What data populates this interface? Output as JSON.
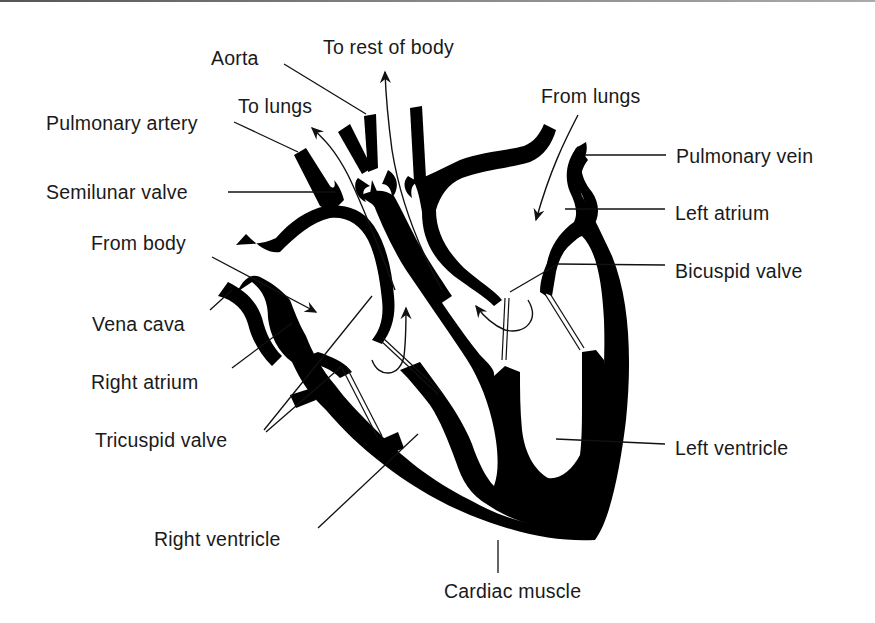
{
  "diagram": {
    "colors": {
      "muscle": "#000000",
      "background": "#ffffff",
      "text": "#1a1a1a"
    },
    "labels": {
      "aorta": "Aorta",
      "to_rest_of_body": "To rest of body",
      "from_lungs": "From lungs",
      "to_lungs": "To lungs",
      "pulmonary_artery": "Pulmonary artery",
      "pulmonary_vein": "Pulmonary vein",
      "semilunar_valve": "Semilunar valve",
      "left_atrium": "Left atrium",
      "from_body": "From body",
      "bicuspid_valve": "Bicuspid valve",
      "vena_cava": "Vena cava",
      "right_atrium": "Right atrium",
      "tricuspid_valve": "Tricuspid valve",
      "left_ventricle": "Left ventricle",
      "right_ventricle": "Right ventricle",
      "cardiac_muscle": "Cardiac muscle"
    },
    "flow_arrows": [
      {
        "name": "to-rest-of-body-arrow",
        "direction": "up"
      },
      {
        "name": "to-lungs-arrow",
        "direction": "up-left"
      },
      {
        "name": "from-lungs-arrow",
        "direction": "down-left"
      },
      {
        "name": "from-body-arrow",
        "direction": "down-right"
      }
    ]
  }
}
